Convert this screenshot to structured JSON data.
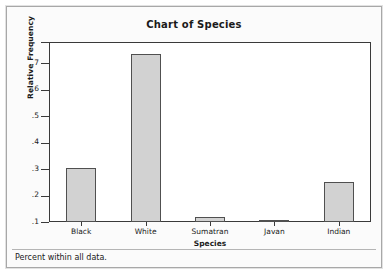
{
  "panel": {
    "footer_note": "Percent within all data."
  },
  "chart_data": {
    "type": "bar",
    "title": "Chart of Species",
    "xlabel": "Species",
    "ylabel": "Relative Frequency",
    "categories": [
      "Black",
      "White",
      "Sumatran",
      "Javan",
      "Indian"
    ],
    "values": [
      0.305,
      0.734,
      0.119,
      0.103,
      0.25
    ],
    "ylim": [
      0.1,
      0.78
    ],
    "ytick_values": [
      0.1,
      0.2,
      0.3,
      0.4,
      0.5,
      0.6,
      0.7,
      0.78
    ],
    "ytick_labels": [
      ".1",
      ".2",
      ".3",
      ".4",
      ".5",
      ".6",
      ".7",
      ""
    ],
    "grid": false,
    "legend": false,
    "bar_fill_color": "#d2d2d2",
    "bar_border_color": "#505050",
    "axis_color": "#3a3a3a",
    "plot_background": "#ffffff",
    "panel_background": "#fbfbfb"
  }
}
